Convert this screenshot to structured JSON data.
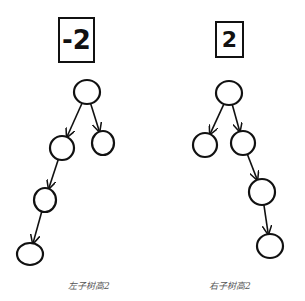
{
  "trees": [
    {
      "id": "left",
      "balance_factor": "-2",
      "caption": "左子树高2",
      "box": {
        "x": 58,
        "y": 17,
        "w": 37,
        "h": 46
      },
      "caption_pos": {
        "x": 68,
        "y": 279
      },
      "nodes": [
        {
          "id": "root",
          "cx": 87,
          "cy": 92,
          "rx": 13,
          "ry": 12
        },
        {
          "id": "left",
          "cx": 62,
          "cy": 148,
          "rx": 12,
          "ry": 12
        },
        {
          "id": "right",
          "cx": 103,
          "cy": 143,
          "rx": 11,
          "ry": 12
        },
        {
          "id": "left-left",
          "cx": 45,
          "cy": 200,
          "rx": 11,
          "ry": 12
        },
        {
          "id": "left-left-left",
          "cx": 30,
          "cy": 254,
          "rx": 13,
          "ry": 11
        }
      ],
      "edges": [
        {
          "from": "root",
          "to": "left"
        },
        {
          "from": "root",
          "to": "right"
        },
        {
          "from": "left",
          "to": "left-left"
        },
        {
          "from": "left-left",
          "to": "left-left-left"
        }
      ]
    },
    {
      "id": "right",
      "balance_factor": "2",
      "caption": "右子树高2",
      "box": {
        "x": 215,
        "y": 21,
        "w": 29,
        "h": 37
      },
      "caption_pos": {
        "x": 209,
        "y": 279
      },
      "nodes": [
        {
          "id": "root",
          "cx": 229,
          "cy": 93,
          "rx": 13,
          "ry": 12
        },
        {
          "id": "left",
          "cx": 205,
          "cy": 145,
          "rx": 12,
          "ry": 12
        },
        {
          "id": "right",
          "cx": 243,
          "cy": 143,
          "rx": 12,
          "ry": 12
        },
        {
          "id": "right-right",
          "cx": 262,
          "cy": 192,
          "rx": 13,
          "ry": 13
        },
        {
          "id": "right-right-right",
          "cx": 270,
          "cy": 246,
          "rx": 13,
          "ry": 12
        }
      ],
      "edges": [
        {
          "from": "root",
          "to": "left"
        },
        {
          "from": "root",
          "to": "right"
        },
        {
          "from": "right",
          "to": "right-right"
        },
        {
          "from": "right-right",
          "to": "right-right-right"
        }
      ]
    }
  ],
  "colors": {
    "stroke": "#111111",
    "caption": "#555555",
    "background": "#ffffff"
  }
}
